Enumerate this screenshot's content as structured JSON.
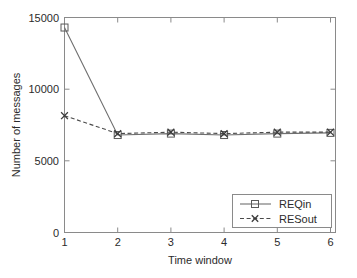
{
  "chart_data": {
    "type": "line",
    "title": "",
    "xlabel": "Time window",
    "ylabel": "Number of messages",
    "x": [
      1,
      2,
      3,
      4,
      5,
      6
    ],
    "xtick_labels": [
      "1",
      "2",
      "3",
      "4",
      "5",
      "6"
    ],
    "ytick_labels": [
      "0",
      "5000",
      "10000",
      "15000"
    ],
    "ytick_values": [
      0,
      5000,
      10000,
      15000
    ],
    "xlim": [
      1,
      6
    ],
    "ylim": [
      0,
      15000
    ],
    "grid": false,
    "legend_position": "lower-right",
    "series": [
      {
        "name": "REQin",
        "values": [
          14300,
          6800,
          6900,
          6800,
          6900,
          6950
        ],
        "linestyle": "solid",
        "marker": "square",
        "color": "#6f6f6f"
      },
      {
        "name": "RESout",
        "values": [
          8150,
          6900,
          7000,
          6900,
          7000,
          7000
        ],
        "linestyle": "dashed",
        "marker": "x",
        "color": "#3a3a3a"
      }
    ]
  },
  "axes": {
    "y_label": "Number of messages",
    "x_label": "Time window",
    "y_ticks": [
      "15000",
      "10000",
      "5000",
      "0"
    ],
    "x_ticks": [
      "1",
      "2",
      "3",
      "4",
      "5",
      "6"
    ]
  },
  "legend": {
    "entries": [
      {
        "label": "REQin"
      },
      {
        "label": "RESout"
      }
    ]
  }
}
